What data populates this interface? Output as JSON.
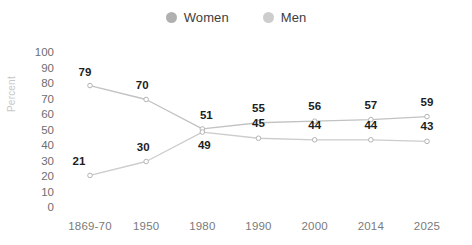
{
  "chart_data": {
    "type": "line",
    "title": "",
    "xlabel": "",
    "ylabel": "Percent",
    "categories": [
      "1869-70",
      "1950",
      "1980",
      "1990",
      "2000",
      "2014",
      "2025"
    ],
    "ylim": [
      0,
      100
    ],
    "yticks": [
      100,
      90,
      80,
      70,
      60,
      50,
      40,
      30,
      20,
      10,
      0
    ],
    "grid": false,
    "legend_position": "top-center",
    "series": [
      {
        "name": "Women",
        "color": "#b0b0b0",
        "values": [
          79,
          70,
          51,
          55,
          56,
          57,
          59
        ],
        "labels": [
          "79",
          "70",
          "51",
          "55",
          "56",
          "57",
          "59"
        ]
      },
      {
        "name": "Men",
        "color": "#c9c9c9",
        "values": [
          21,
          30,
          49,
          45,
          44,
          44,
          43
        ],
        "labels": [
          "21",
          "30",
          "49",
          "45",
          "44",
          "44",
          "43"
        ]
      }
    ]
  },
  "legend": {
    "items": [
      {
        "label": "Women",
        "marker": "legend-dot-women",
        "color": "#b0b0b0"
      },
      {
        "label": "Men",
        "marker": "legend-dot-men",
        "color": "#cdcdcd"
      }
    ]
  },
  "colors": {
    "background": "#ffffff",
    "women_line": "#c2c2c2",
    "men_line": "#cccccc",
    "marker_fill": "#ffffff",
    "marker_stroke": "#b4b4b4",
    "tick_text": "#6e6e6e",
    "data_label_text": "#1d1d1d",
    "axis_title_text": "#c8c8c8"
  }
}
